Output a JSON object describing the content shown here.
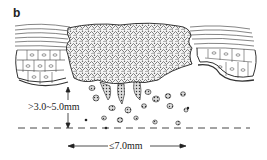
{
  "figure": {
    "panel_label": "b",
    "depth_measurement": ">3.0~5.0mm",
    "width_measurement": "≤7.0mm",
    "structures": [
      "stratified-squamous-epithelium-left",
      "stratified-squamous-epithelium-right",
      "tumor-mass",
      "invading-tumor-nests",
      "invasion-depth-baseline"
    ],
    "colors": {
      "ink": "#222222",
      "background": "#ffffff"
    }
  }
}
